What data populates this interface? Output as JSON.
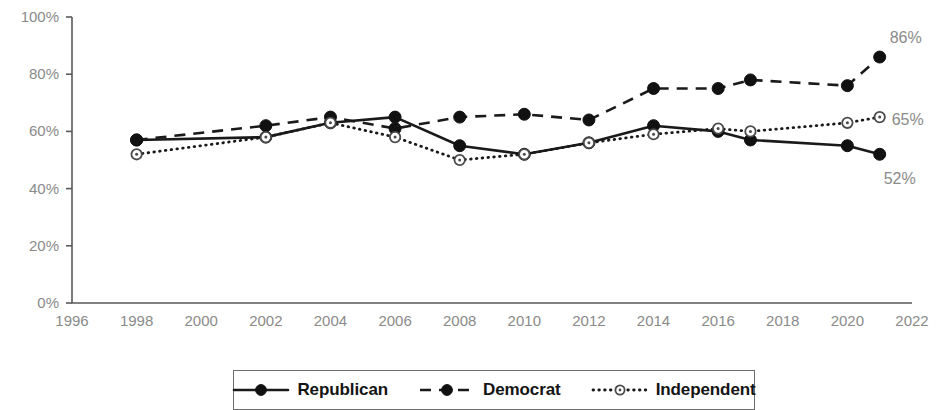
{
  "chart_data": {
    "type": "line",
    "title": "",
    "subtitle": "",
    "xlabel": "",
    "ylabel": "",
    "xlim": [
      1996,
      2022
    ],
    "ylim": [
      0,
      100
    ],
    "grid": false,
    "legend_position": "bottom",
    "x_tick_labels": [
      "1996",
      "1998",
      "2000",
      "2002",
      "2004",
      "2006",
      "2008",
      "2010",
      "2012",
      "2014",
      "2016",
      "2018",
      "2020",
      "2022"
    ],
    "x_ticks": [
      1996,
      1998,
      2000,
      2002,
      2004,
      2006,
      2008,
      2010,
      2012,
      2014,
      2016,
      2018,
      2020,
      2022
    ],
    "y_tick_labels": [
      "0%",
      "20%",
      "40%",
      "60%",
      "80%",
      "100%"
    ],
    "y_ticks": [
      0,
      20,
      40,
      60,
      80,
      100
    ],
    "series": [
      {
        "name": "Republican",
        "line_style": "solid",
        "marker": "filled-circle",
        "color": "#111111",
        "x": [
          1998,
          2002,
          2004,
          2006,
          2008,
          2010,
          2012,
          2014,
          2016,
          2017,
          2020,
          2021
        ],
        "values": [
          57,
          58,
          63,
          65,
          55,
          52,
          56,
          62,
          60,
          57,
          55,
          52
        ]
      },
      {
        "name": "Democrat",
        "line_style": "dashed",
        "marker": "filled-circle",
        "color": "#111111",
        "x": [
          1998,
          2002,
          2004,
          2006,
          2008,
          2010,
          2012,
          2014,
          2016,
          2017,
          2020,
          2021
        ],
        "values": [
          57,
          62,
          65,
          61,
          65,
          66,
          64,
          75,
          75,
          78,
          76,
          86
        ]
      },
      {
        "name": "Independent",
        "line_style": "dotted",
        "marker": "open-circle",
        "color": "#4a4a4a",
        "x": [
          1998,
          2002,
          2004,
          2006,
          2008,
          2010,
          2012,
          2014,
          2016,
          2017,
          2020,
          2021
        ],
        "values": [
          52,
          58,
          63,
          58,
          50,
          52,
          56,
          59,
          61,
          60,
          63,
          65
        ]
      }
    ],
    "annotations": [
      {
        "text": "86%",
        "series": "Democrat",
        "x": 2021,
        "y": 86
      },
      {
        "text": "65%",
        "series": "Independent",
        "x": 2021,
        "y": 65
      },
      {
        "text": "52%",
        "series": "Republican",
        "x": 2021,
        "y": 52
      }
    ]
  },
  "legend": {
    "entries": [
      {
        "label": "Republican",
        "style": "solid"
      },
      {
        "label": "Democrat",
        "style": "dashed"
      },
      {
        "label": "Independent",
        "style": "dotted"
      }
    ]
  }
}
